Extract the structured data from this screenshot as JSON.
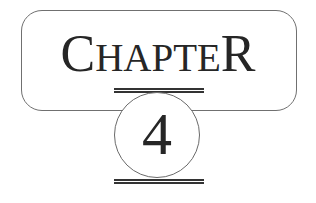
{
  "heading": {
    "label": "Chapter",
    "first_letter": "C",
    "middle_letters": "HAPTE",
    "last_letter": "R",
    "number": "4"
  },
  "colors": {
    "text": "#262626",
    "frame_stroke": "#707070",
    "rule": "#333333",
    "background": "#ffffff"
  }
}
